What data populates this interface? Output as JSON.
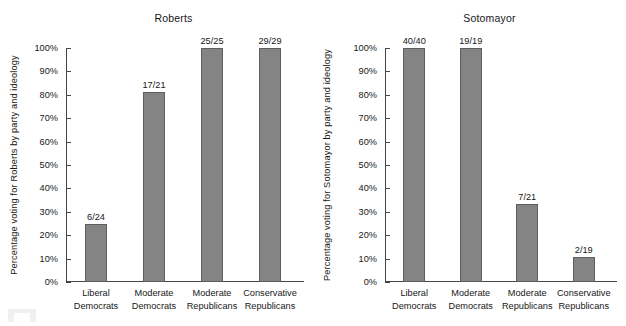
{
  "chart_data": [
    {
      "type": "bar",
      "title": "Roberts",
      "xlabel": "",
      "ylabel": "Percentage voting for Roberts by party and ideology",
      "ylim": [
        0,
        100
      ],
      "grid": false,
      "legend": "none",
      "categories": [
        "Liberal Democrats",
        "Moderate Democrats",
        "Moderate Republicans",
        "Conservative Republicans"
      ],
      "category_lines": [
        [
          "Liberal",
          "Democrats"
        ],
        [
          "Moderate",
          "Democrats"
        ],
        [
          "Moderate",
          "Republicans"
        ],
        [
          "Conservative",
          "Republicans"
        ]
      ],
      "values": [
        25.0,
        81.0,
        100.0,
        100.0
      ],
      "data_labels": [
        "6/24",
        "17/21",
        "25/25",
        "29/29"
      ],
      "ytick_labels": [
        "0%",
        "10%",
        "20%",
        "30%",
        "40%",
        "50%",
        "60%",
        "70%",
        "80%",
        "90%",
        "100%"
      ],
      "ytick_values": [
        0,
        10,
        20,
        30,
        40,
        50,
        60,
        70,
        80,
        90,
        100
      ]
    },
    {
      "type": "bar",
      "title": "Sotomayor",
      "xlabel": "",
      "ylabel": "Percentage voting for Sotomayor by party and ideology",
      "ylim": [
        0,
        100
      ],
      "grid": false,
      "legend": "none",
      "categories": [
        "Liberal Democrats",
        "Moderate Democrats",
        "Moderate Republicans",
        "Conservative Republicans"
      ],
      "category_lines": [
        [
          "Liberal",
          "Democrats"
        ],
        [
          "Moderate",
          "Democrats"
        ],
        [
          "Moderate",
          "Republicans"
        ],
        [
          "Conservative",
          "Republicans"
        ]
      ],
      "values": [
        100.0,
        100.0,
        33.3,
        10.5
      ],
      "data_labels": [
        "40/40",
        "19/19",
        "7/21",
        "2/19"
      ],
      "ytick_labels": [
        "0%",
        "10%",
        "20%",
        "30%",
        "40%",
        "50%",
        "60%",
        "70%",
        "80%",
        "90%",
        "100%"
      ],
      "ytick_values": [
        0,
        10,
        20,
        30,
        40,
        50,
        60,
        70,
        80,
        90,
        100
      ]
    }
  ],
  "colors": {
    "bar_fill": "#848484",
    "bar_stroke": "#5e5e5e",
    "axis": "#444444",
    "text": "#171717",
    "background": "#ffffff"
  }
}
